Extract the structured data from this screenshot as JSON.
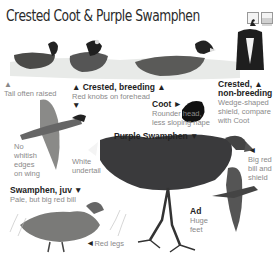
{
  "page": {
    "title": "Crested Coot & Purple Swamphen",
    "header_icons": [
      {
        "name": "bird-silhouette-icon"
      },
      {
        "name": "habitat-lines-icon"
      }
    ]
  },
  "labels": {
    "tail": "Tail often raised",
    "crested_breeding_title": "Crested, breeding",
    "crested_breeding_desc": "Red knobs on forehead",
    "crested_nonbreeding_title_1": "Crested,",
    "crested_nonbreeding_title_2": "non-breeding",
    "crested_nonbreeding_desc_1": "Wedge-shaped",
    "crested_nonbreeding_desc_2": "shield, compare",
    "crested_nonbreeding_desc_3": "with Coot",
    "coot_title": "Coot",
    "coot_desc_1": "Rounder head,",
    "coot_desc_2": "less sloping nape",
    "no_whitish_1": "No",
    "no_whitish_2": "whitish",
    "no_whitish_3": "edges",
    "no_whitish_4": "on wing",
    "white_undertail_1": "White",
    "white_undertail_2": "undertail",
    "purple_swamphen": "Purple Swamphen",
    "big_red_1": "Big red",
    "big_red_2": "bill and",
    "big_red_3": "shield",
    "juv_title": "Swamphen, juv",
    "juv_desc": "Pale, but big red bill",
    "red_legs": "Red legs",
    "ad_title": "Ad",
    "ad_desc_1": "Huge",
    "ad_desc_2": "feet"
  },
  "markers": {
    "up": "▲",
    "down": "▼",
    "right": "►",
    "left": "◄"
  }
}
